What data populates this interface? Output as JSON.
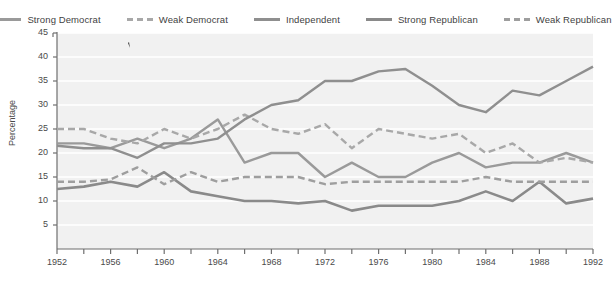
{
  "chart_data": {
    "type": "line",
    "title": "",
    "xlabel": "",
    "ylabel": "Percentage",
    "xlim": [
      1952,
      1992
    ],
    "ylim": [
      0,
      45
    ],
    "yticks": [
      5,
      10,
      15,
      20,
      25,
      30,
      35,
      40,
      45
    ],
    "xticks": [
      1952,
      1954,
      1956,
      1958,
      1960,
      1962,
      1964,
      1966,
      1968,
      1970,
      1972,
      1974,
      1976,
      1978,
      1980,
      1982,
      1984,
      1986,
      1988,
      1990,
      1992
    ],
    "xtick_labels": [
      "1952",
      "1956",
      "1960",
      "1964",
      "1968",
      "1972",
      "1976",
      "1980",
      "1984",
      "1988",
      "1992"
    ],
    "xtick_label_years": [
      1952,
      1956,
      1960,
      1964,
      1968,
      1972,
      1976,
      1980,
      1984,
      1988,
      1992
    ],
    "grid": "horizontal",
    "grid_color": "#ffffff",
    "plot_background": "#f1f1f1",
    "legend_position": "top",
    "x": [
      1952,
      1954,
      1956,
      1958,
      1960,
      1962,
      1964,
      1966,
      1968,
      1970,
      1972,
      1974,
      1976,
      1978,
      1980,
      1982,
      1984,
      1986,
      1988,
      1990,
      1992
    ],
    "series": [
      {
        "name": "Strong Democrat",
        "color": "#9a9a9a",
        "style": "solid",
        "width": 2.4,
        "values": [
          22,
          22,
          21,
          23,
          21,
          23,
          27,
          18,
          20,
          20,
          15,
          18,
          15,
          15,
          18,
          20,
          17,
          18,
          18,
          20,
          18
        ]
      },
      {
        "name": "Weak Democrat",
        "color": "#a8a8a8",
        "style": "dashed",
        "width": 2.4,
        "values": [
          25,
          25,
          23,
          22,
          25,
          23,
          25,
          28,
          25,
          24,
          26,
          21,
          25,
          24,
          23,
          24,
          20,
          22,
          18,
          19,
          18
        ]
      },
      {
        "name": "Independent",
        "color": "#8f8f8f",
        "style": "solid",
        "width": 2.4,
        "values": [
          21.5,
          21,
          21,
          19,
          22,
          22,
          23,
          27,
          30,
          31,
          35,
          35,
          37,
          37.5,
          34,
          30,
          28.5,
          33,
          32,
          35,
          38
        ]
      },
      {
        "name": "Strong Republican",
        "color": "#8a8a8a",
        "style": "solid",
        "width": 2.6,
        "values": [
          12.5,
          13,
          14,
          13,
          16,
          12,
          11,
          10,
          10,
          9.5,
          10,
          8,
          9,
          9,
          9,
          10,
          12,
          10,
          14,
          9.5,
          10.5
        ]
      },
      {
        "name": "Weak Republican",
        "color": "#9e9e9e",
        "style": "dashed",
        "width": 2.4,
        "values": [
          14,
          14,
          14.5,
          17,
          13.5,
          16,
          14,
          15,
          15,
          15,
          13.5,
          14,
          14,
          14,
          14,
          14,
          15,
          14,
          14,
          14,
          14
        ]
      }
    ]
  },
  "legend": {
    "items": [
      {
        "label": "Strong Democrat"
      },
      {
        "label": "Weak Democrat"
      },
      {
        "label": "Independent"
      },
      {
        "label": "Strong Republican"
      },
      {
        "label": "Weak Republican"
      }
    ]
  },
  "axes": {
    "y_title": "Percentage",
    "y_tick_labels": [
      "45",
      "40",
      "35",
      "30",
      "25",
      "20",
      "15",
      "10",
      "5"
    ],
    "x_tick_labels": [
      "1952",
      "1956",
      "1960",
      "1964",
      "1968",
      "1972",
      "1976",
      "1980",
      "1984",
      "1988",
      "1992"
    ]
  },
  "caption": {
    "text": ""
  }
}
